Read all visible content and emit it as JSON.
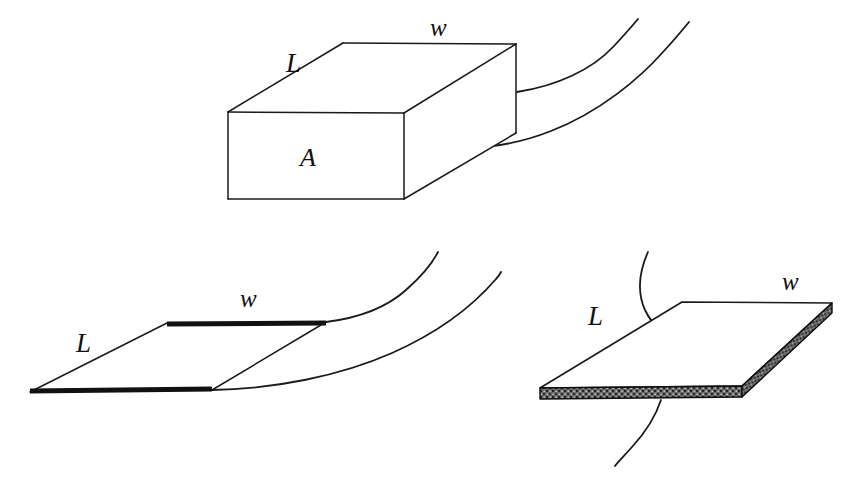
{
  "figure": {
    "background_color": "#ffffff",
    "line_color": "#1a1a1a",
    "hatch_color": "#585858",
    "panels": [
      {
        "id": "top-box",
        "name": "rectangular-block",
        "description": "Three-dimensional rectangular block with two flow streamlines leaving its right end",
        "labels": [
          {
            "name": "length-label",
            "text": "L",
            "x": 286,
            "y": 72
          },
          {
            "name": "width-label",
            "text": "w",
            "x": 430,
            "y": 36
          },
          {
            "name": "area-label",
            "text": "A",
            "x": 300,
            "y": 166
          }
        ],
        "curve_count": 2
      },
      {
        "id": "bottom-left-plate",
        "name": "flat-plate",
        "description": "Thin flat plate drawn as a parallelogram with bold leading and trailing edges and two streamlines",
        "labels": [
          {
            "name": "length-label",
            "text": "L",
            "x": 76,
            "y": 352
          },
          {
            "name": "width-label",
            "text": "w",
            "x": 240,
            "y": 307
          }
        ],
        "curve_count": 2
      },
      {
        "id": "bottom-right-plate",
        "name": "thick-plate",
        "description": "Plate with finite thickness shown as a stippled grey slab edge, crossed by a single streamline",
        "labels": [
          {
            "name": "length-label",
            "text": "L",
            "x": 588,
            "y": 325
          },
          {
            "name": "width-label",
            "text": "w",
            "x": 782,
            "y": 290
          }
        ],
        "curve_count": 2
      }
    ]
  }
}
